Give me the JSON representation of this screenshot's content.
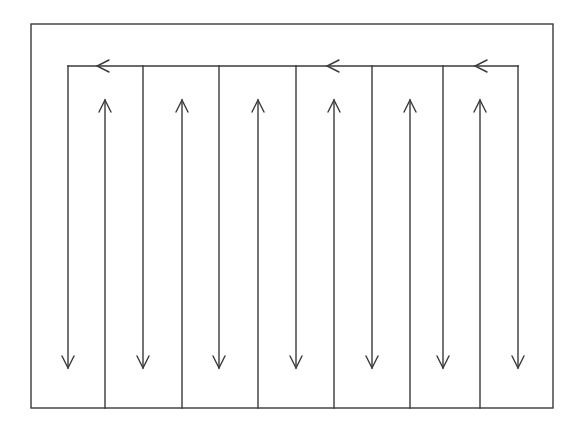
{
  "diagram": {
    "type": "boustrophedon-path",
    "stroke_color": "#3a3a3a",
    "background_color": "#ffffff",
    "outer_boundary": {
      "x1": 31,
      "y1": 24,
      "x2": 553,
      "y2": 408
    },
    "top_connector": {
      "y": 66,
      "x_start": 518,
      "x_end": 68
    },
    "top_left_arrows_x": [
      97,
      327,
      475
    ],
    "down_lanes_x": [
      68,
      143,
      219,
      296,
      372,
      443,
      518
    ],
    "up_lanes_x": [
      105,
      182,
      258,
      334,
      410,
      480
    ],
    "down_lane_range": {
      "y_top": 66,
      "y_tip": 368
    },
    "up_lane_range": {
      "y_bottom": 408,
      "y_tip": 100
    },
    "arrow_head": {
      "half_width": 6,
      "length": 12
    }
  }
}
